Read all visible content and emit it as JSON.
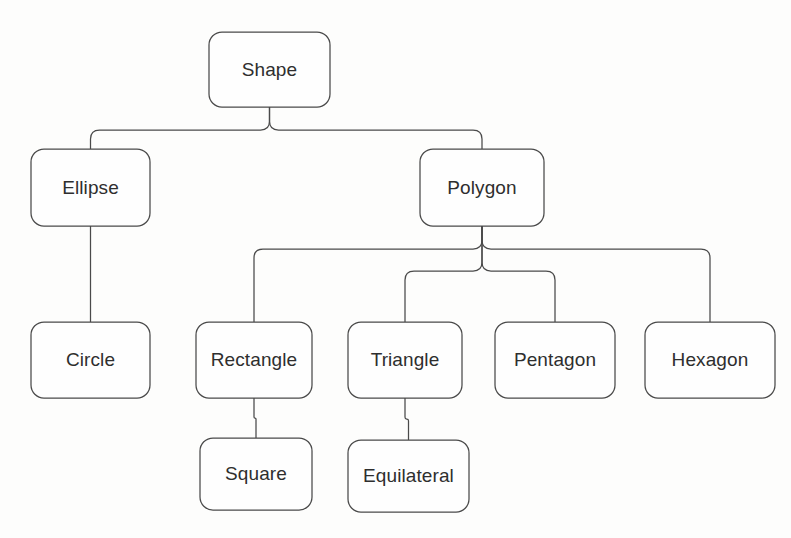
{
  "figure": {
    "background_color": "#fdfdfc",
    "stroke_color": "#4a4a4a",
    "node_fill_color": "#fefefe",
    "label_color": "#2e2e2e",
    "caption": ""
  },
  "diagram": {
    "type": "tree",
    "root": "Shape",
    "levels": [
      [
        "Shape"
      ],
      [
        "Ellipse",
        "Polygon"
      ],
      [
        "Circle",
        "Rectangle",
        "Triangle",
        "Pentagon",
        "Hexagon"
      ],
      [
        "Square",
        "Equilateral"
      ]
    ],
    "nodes": [
      {
        "id": "shape",
        "label": "Shape",
        "x": 209,
        "y": 32,
        "w": 121,
        "h": 75,
        "level": 0
      },
      {
        "id": "ellipse",
        "label": "Ellipse",
        "x": 31,
        "y": 149,
        "w": 119,
        "h": 77,
        "level": 1
      },
      {
        "id": "polygon",
        "label": "Polygon",
        "x": 420,
        "y": 149,
        "w": 124,
        "h": 77,
        "level": 1
      },
      {
        "id": "circle",
        "label": "Circle",
        "x": 31,
        "y": 322,
        "w": 119,
        "h": 76,
        "level": 2
      },
      {
        "id": "rectangle",
        "label": "Rectangle",
        "x": 196,
        "y": 322,
        "w": 116,
        "h": 76,
        "level": 2
      },
      {
        "id": "triangle",
        "label": "Triangle",
        "x": 348,
        "y": 322,
        "w": 114,
        "h": 76,
        "level": 2
      },
      {
        "id": "pentagon",
        "label": "Pentagon",
        "x": 495,
        "y": 322,
        "w": 120,
        "h": 76,
        "level": 2
      },
      {
        "id": "hexagon",
        "label": "Hexagon",
        "x": 645,
        "y": 322,
        "w": 130,
        "h": 76,
        "level": 2
      },
      {
        "id": "square",
        "label": "Square",
        "x": 200,
        "y": 438,
        "w": 112,
        "h": 72,
        "level": 3
      },
      {
        "id": "equilateral",
        "label": "Equilateral",
        "x": 348,
        "y": 440,
        "w": 121,
        "h": 72,
        "level": 3
      }
    ],
    "edges": [
      {
        "from": "shape",
        "to": "ellipse",
        "bus_y": 130
      },
      {
        "from": "shape",
        "to": "polygon",
        "bus_y": 130
      },
      {
        "from": "polygon",
        "to": "rectangle",
        "bus_y": 249
      },
      {
        "from": "polygon",
        "to": "hexagon",
        "bus_y": 249
      },
      {
        "from": "polygon",
        "to": "triangle",
        "bus_y": 271
      },
      {
        "from": "polygon",
        "to": "pentagon",
        "bus_y": 271
      },
      {
        "from": "ellipse",
        "to": "circle",
        "bus_y": null
      },
      {
        "from": "rectangle",
        "to": "square",
        "bus_y": null
      },
      {
        "from": "triangle",
        "to": "equilateral",
        "bus_y": null
      }
    ]
  }
}
